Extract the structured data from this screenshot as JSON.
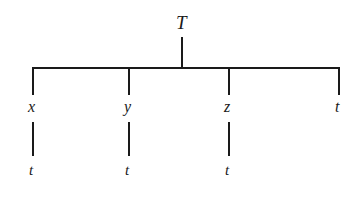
{
  "diagram": {
    "kind": "tree-diagram",
    "background_color": "#ffffff",
    "line_color": "#1a1a1a",
    "text_color": "#1a1a1a",
    "line_width": 2,
    "root": {
      "label": "T",
      "x": 182,
      "label_x": 176,
      "label_y": 13
    },
    "level1": {
      "bar_y": 68,
      "bar_x_start": 33,
      "bar_x_end": 339,
      "stem_top": 37,
      "branch_bottom": 95,
      "nodes": [
        {
          "label": "x",
          "x": 33,
          "label_x": 28,
          "label_y": 99,
          "has_child": true
        },
        {
          "label": "y",
          "x": 129,
          "label_x": 124,
          "label_y": 99,
          "has_child": true
        },
        {
          "label": "z",
          "x": 229,
          "label_x": 224,
          "label_y": 99,
          "has_child": true
        },
        {
          "label": "t",
          "x": 339,
          "label_x": 335,
          "label_y": 99,
          "has_child": false
        }
      ]
    },
    "level2": {
      "edge_top": 122,
      "edge_bottom": 156,
      "nodes": [
        {
          "label": "t",
          "x": 33,
          "label_x": 29,
          "label_y": 163
        },
        {
          "label": "t",
          "x": 129,
          "label_x": 125,
          "label_y": 163
        },
        {
          "label": "t",
          "x": 229,
          "label_x": 225,
          "label_y": 163
        }
      ]
    }
  }
}
